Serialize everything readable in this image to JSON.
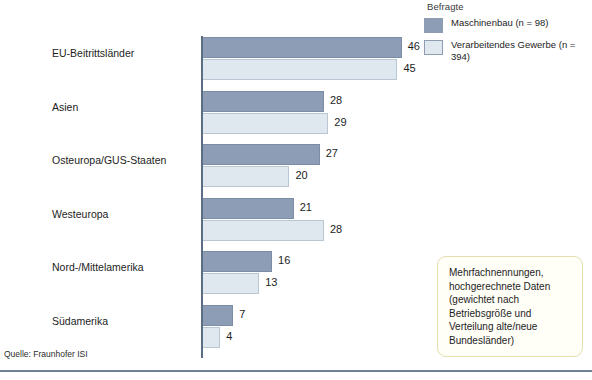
{
  "legend": {
    "title": "Befragte",
    "items": [
      {
        "label": "Maschinenbau  (n = 98)",
        "color": "#8d9db5",
        "swatch_name": "legend-swatch-maschinenbau"
      },
      {
        "label": "Verarbeitendes Gewerbe (n = 394)",
        "color": "#dfe7ef",
        "swatch_name": "legend-swatch-verarbeitendes-gewerbe"
      }
    ]
  },
  "note": {
    "text": "Mehrfachnennungen, hochgerechnete Daten (gewichtet nach Betriebsgröße und Verteilung alte/neue Bundesländer)"
  },
  "source": {
    "text": "Quelle: Fraunhofer ISI"
  },
  "chart_data": {
    "type": "bar",
    "orientation": "horizontal",
    "title": "",
    "subtitle": "",
    "xlabel": "",
    "ylabel": "",
    "xlim": [
      0,
      50
    ],
    "grid": false,
    "legend_position": "top-right",
    "categories": [
      "EU-Beitrittsländer",
      "Asien",
      "Osteuropa/GUS-Staaten",
      "Westeuropa",
      "Nord-/Mittelamerika",
      "Südamerika"
    ],
    "series": [
      {
        "name": "Maschinenbau  (n = 98)",
        "color": "#8d9db5",
        "values": [
          46,
          28,
          27,
          21,
          16,
          7
        ]
      },
      {
        "name": "Verarbeitendes Gewerbe (n = 394)",
        "color": "#dfe7ef",
        "values": [
          45,
          29,
          20,
          28,
          13,
          4
        ]
      }
    ]
  },
  "colors": {
    "dark_bar": "#8d9db5",
    "light_bar": "#dfe7ef",
    "axis": "#5c6e84",
    "rule": "#6f8196",
    "note_border": "#e3dfae",
    "note_background": "#fffef7"
  }
}
